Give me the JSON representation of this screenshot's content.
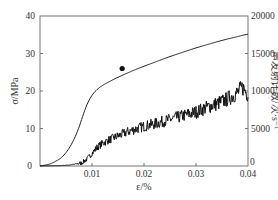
{
  "chart_data": {
    "type": "line",
    "title": "",
    "xlabel": "ε/%",
    "ylabel": "σ/MPa",
    "y2label": "声发射计数/次·s⁻¹",
    "xlim": [
      0,
      0.04
    ],
    "ylim": [
      0,
      40
    ],
    "y2lim": [
      0,
      20000
    ],
    "x_ticks": [
      "0.01",
      "0.02",
      "0.03",
      "0.04"
    ],
    "y_ticks": [
      "0",
      "10",
      "20",
      "30",
      "40"
    ],
    "y2_ticks": [
      "0",
      "5000",
      "10000",
      "15000",
      "20000"
    ],
    "grid": false,
    "legend": null,
    "series": [
      {
        "name": "σ (stress)",
        "axis": "left",
        "style": "smooth line",
        "x": [
          0,
          0.002,
          0.004,
          0.005,
          0.006,
          0.007,
          0.0075,
          0.008,
          0.009,
          0.01,
          0.011,
          0.012,
          0.014,
          0.016,
          0.018,
          0.02,
          0.025,
          0.03,
          0.035,
          0.04
        ],
        "values": [
          0,
          0.5,
          2,
          3.5,
          5.5,
          8.5,
          10,
          12.5,
          16.5,
          19,
          20.5,
          21.5,
          23,
          24.3,
          25.5,
          26.6,
          29.2,
          31.5,
          33.5,
          35.2
        ]
      },
      {
        "name": "声发射计数 (AE count)",
        "axis": "right",
        "style": "noisy line",
        "x": [
          0,
          0.004,
          0.006,
          0.008,
          0.009,
          0.01,
          0.011,
          0.012,
          0.013,
          0.015,
          0.017,
          0.02,
          0.022,
          0.025,
          0.028,
          0.03,
          0.032,
          0.034,
          0.036,
          0.038,
          0.039,
          0.04
        ],
        "values": [
          0,
          50,
          150,
          400,
          900,
          1700,
          2500,
          3000,
          3400,
          4000,
          4600,
          5300,
          5600,
          6200,
          6800,
          7200,
          7800,
          8300,
          8900,
          9800,
          10500,
          9500
        ]
      }
    ],
    "annotations": [
      {
        "type": "marker",
        "shape": "filled-circle",
        "x": 0.0158,
        "y": 26,
        "axis": "left"
      }
    ]
  }
}
